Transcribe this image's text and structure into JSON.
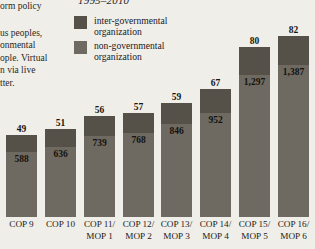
{
  "left_column_text": {
    "clipped_lines_top": [
      "orm policy"
    ],
    "clipped_lines_body": [
      "us peoples,",
      "onmental",
      "ople. Virtual",
      "n via live",
      "tter."
    ]
  },
  "chart_data": {
    "type": "bar",
    "title": "1995–2010",
    "subtitle": "",
    "xlabel": "",
    "ylabel": "",
    "stacked": true,
    "grid": false,
    "legend_position": "top",
    "ylim": [
      0,
      1500
    ],
    "categories": [
      "COP 9",
      "COP 10",
      "COP 11/\nMOP 1",
      "COP 12/\nMOP 2",
      "COP 13/\nMOP 3",
      "COP 14/\nMOP 4",
      "COP 15/\nMOP 5",
      "COP 16/\nMOP 6"
    ],
    "series": [
      {
        "name": "inter-governmental organization",
        "color": "#555149",
        "values": [
          49,
          51,
          56,
          57,
          59,
          67,
          80,
          82
        ],
        "value_labels": [
          "49",
          "51",
          "56",
          "57",
          "59",
          "67",
          "80",
          "82"
        ],
        "label_position": "above-bar"
      },
      {
        "name": "non-governmental organization",
        "color": "#6e6a62",
        "values": [
          588,
          636,
          739,
          768,
          846,
          952,
          1297,
          1387
        ],
        "value_labels": [
          "588",
          "636",
          "739",
          "768",
          "846",
          "952",
          "1,297",
          "1,387"
        ],
        "label_position": "inside-top"
      }
    ]
  },
  "legend": {
    "items": [
      {
        "label": "inter-governmental organization",
        "color": "#555149"
      },
      {
        "label": "non-governmental organization",
        "color": "#6e6a62"
      }
    ]
  },
  "x_axis": {
    "labels": [
      {
        "line1": "COP 9",
        "line2": ""
      },
      {
        "line1": "COP 10",
        "line2": ""
      },
      {
        "line1": "COP 11/",
        "line2": "MOP 1"
      },
      {
        "line1": "COP 12/",
        "line2": "MOP 2"
      },
      {
        "line1": "COP 13/",
        "line2": "MOP 3"
      },
      {
        "line1": "COP 14/",
        "line2": "MOP 4"
      },
      {
        "line1": "COP 15/",
        "line2": "MOP 5"
      },
      {
        "line1": "COP 16/",
        "line2": "MOP 6"
      }
    ]
  },
  "colors": {
    "background": "#efeee9",
    "igo": "#555149",
    "ngo": "#6e6a62",
    "text": "#22201d"
  }
}
